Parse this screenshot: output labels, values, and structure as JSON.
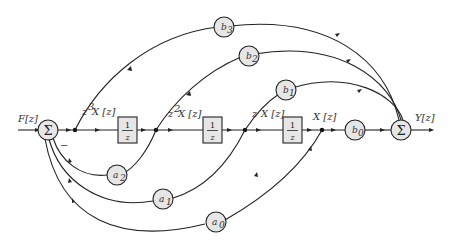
{
  "diagram": {
    "input_label": "F[z]",
    "output_label": "Y[z]",
    "summers": [
      {
        "id": "sum-input",
        "symbol": "Σ"
      },
      {
        "id": "sum-output",
        "symbol": "Σ"
      }
    ],
    "signal_labels": [
      "z³X[z]",
      "z²X[z]",
      "zX[z]",
      "X[z]"
    ],
    "signal_labels_parts": [
      {
        "pre": "z",
        "sup": "3",
        "post": "X [z]"
      },
      {
        "pre": "z",
        "sup": "2",
        "post": "X [z]"
      },
      {
        "pre": "z ",
        "sup": "",
        "post": "X [z]"
      },
      {
        "pre": "",
        "sup": "",
        "post": "X [z]"
      }
    ],
    "delays": [
      {
        "num": "1",
        "den": "z"
      },
      {
        "num": "1",
        "den": "z"
      },
      {
        "num": "1",
        "den": "z"
      }
    ],
    "feedforward_gains": [
      {
        "base": "b",
        "sub": "3"
      },
      {
        "base": "b",
        "sub": "2"
      },
      {
        "base": "b",
        "sub": "1"
      },
      {
        "base": "b",
        "sub": "0"
      }
    ],
    "feedback_gains": [
      {
        "base": "a",
        "sub": "2"
      },
      {
        "base": "a",
        "sub": "1"
      },
      {
        "base": "a",
        "sub": "0"
      }
    ],
    "feedback_sign": "−"
  }
}
